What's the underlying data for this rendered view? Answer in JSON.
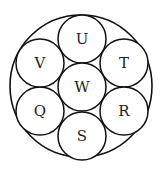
{
  "diagram": {
    "outer_circle": {
      "cx": 81,
      "cy": 86,
      "r": 71
    },
    "inner_radius": 24,
    "stroke_color": "#111111",
    "circles": [
      {
        "label": "U",
        "cx": 82,
        "cy": 39
      },
      {
        "label": "T",
        "cx": 124,
        "cy": 63
      },
      {
        "label": "R",
        "cx": 124,
        "cy": 111
      },
      {
        "label": "S",
        "cx": 82,
        "cy": 136
      },
      {
        "label": "Q",
        "cx": 40,
        "cy": 111
      },
      {
        "label": "V",
        "cx": 40,
        "cy": 63
      },
      {
        "label": "W",
        "cx": 82,
        "cy": 87
      }
    ]
  }
}
